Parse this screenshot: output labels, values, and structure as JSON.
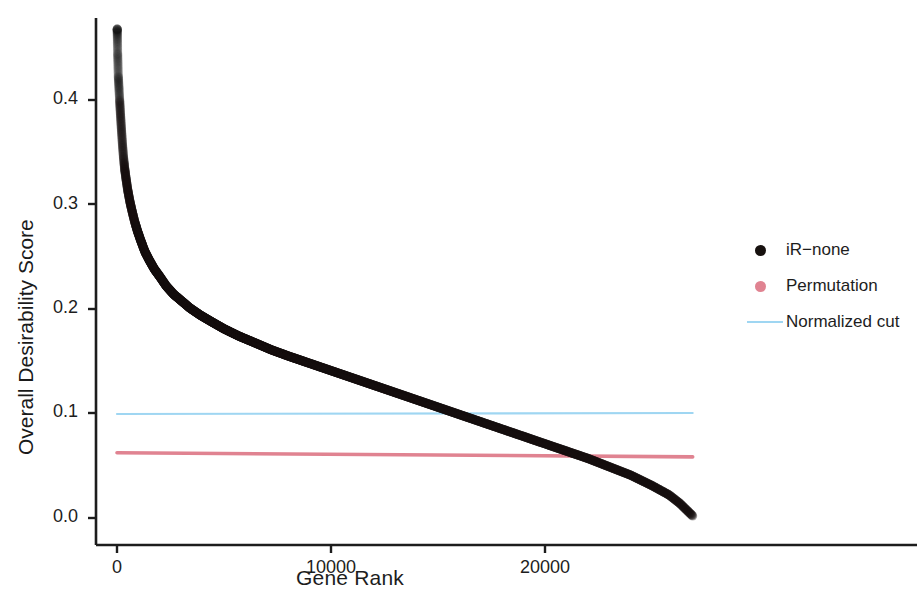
{
  "chart_data": {
    "type": "scatter",
    "title": "",
    "xlabel": "Gene Rank",
    "ylabel": "Overall Desirability Score",
    "xlim": [
      -1400,
      27800
    ],
    "ylim": [
      -0.012,
      0.475
    ],
    "xticks": [
      0,
      10000,
      20000
    ],
    "xticklabels": [
      "0",
      "10000",
      "20000"
    ],
    "yticks": [
      0.0,
      0.1,
      0.2,
      0.3,
      0.4
    ],
    "yticklabels": [
      "0.0",
      "0.1",
      "0.2",
      "0.3",
      "0.4"
    ],
    "grid": false,
    "legend_position": "right",
    "series": [
      {
        "name": "iR-none",
        "type": "scatter",
        "color": "#17110f",
        "marker": "circle",
        "x": [
          10,
          30,
          60,
          90,
          120,
          160,
          200,
          250,
          300,
          360,
          420,
          500,
          600,
          700,
          820,
          950,
          1100,
          1300,
          1500,
          1750,
          2000,
          2300,
          2650,
          3000,
          3400,
          3900,
          4400,
          5000,
          5700,
          6400,
          7200,
          8000,
          9000,
          10000,
          11000,
          12000,
          13000,
          14000,
          15000,
          16000,
          17000,
          18000,
          19000,
          20000,
          21000,
          22000,
          23000,
          24000,
          25000,
          25800,
          26300,
          26700,
          26900
        ],
        "y": [
          0.468,
          0.445,
          0.423,
          0.412,
          0.401,
          0.387,
          0.374,
          0.359,
          0.346,
          0.334,
          0.325,
          0.314,
          0.303,
          0.294,
          0.284,
          0.275,
          0.266,
          0.255,
          0.247,
          0.238,
          0.231,
          0.222,
          0.214,
          0.208,
          0.201,
          0.194,
          0.188,
          0.181,
          0.174,
          0.168,
          0.161,
          0.155,
          0.148,
          0.141,
          0.134,
          0.127,
          0.12,
          0.113,
          0.106,
          0.099,
          0.092,
          0.085,
          0.078,
          0.071,
          0.064,
          0.057,
          0.049,
          0.041,
          0.031,
          0.022,
          0.014,
          0.006,
          0.002
        ]
      },
      {
        "name": "Permutation",
        "type": "line",
        "color": "#e08391",
        "x": [
          0,
          26900
        ],
        "y": [
          0.0625,
          0.0585
        ]
      },
      {
        "name": "Normalized cut",
        "type": "line",
        "color": "#9fd6f2",
        "x": [
          0,
          26900
        ],
        "y": [
          0.0995,
          0.1005
        ]
      }
    ]
  },
  "axes": {
    "y_title": "Overall Desirability Score",
    "x_title": "Gene Rank",
    "y_ticks": [
      {
        "label": "0.4"
      },
      {
        "label": "0.3"
      },
      {
        "label": "0.2"
      },
      {
        "label": "0.1"
      },
      {
        "label": "0.0"
      }
    ],
    "x_ticks": [
      {
        "label": "0"
      },
      {
        "label": "10000"
      },
      {
        "label": "20000"
      }
    ]
  },
  "legend": {
    "items": [
      {
        "label": "iR−none",
        "key": "dot",
        "color": "#17110f"
      },
      {
        "label": "Permutation",
        "key": "dot",
        "color": "#e08391"
      },
      {
        "label": "Normalized cut",
        "key": "line",
        "color": "#9fd6f2"
      }
    ]
  },
  "colors": {
    "axis": "#1d1d1d",
    "scatter": "#17110f",
    "permutation": "#e08391",
    "normalized_cut": "#9fd6f2",
    "background": "#ffffff"
  }
}
